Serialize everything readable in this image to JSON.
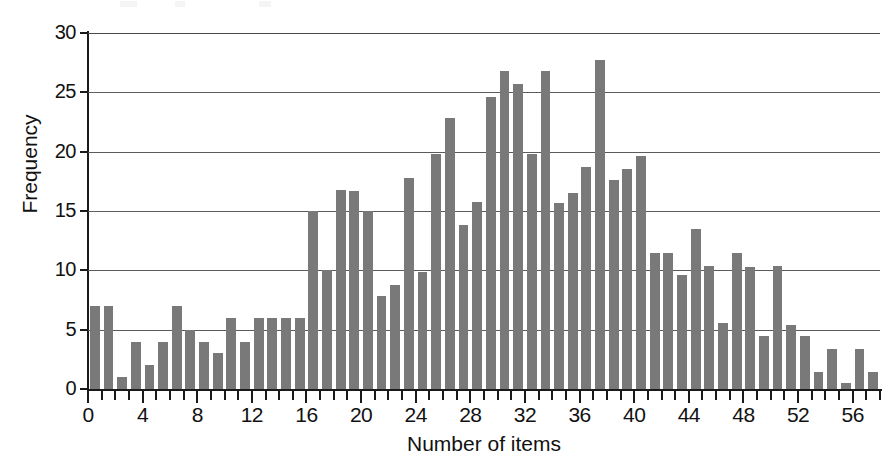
{
  "chart_data": {
    "type": "bar",
    "title": "",
    "subtitle": "",
    "xlabel": "Number of items",
    "ylabel": "Frequency",
    "xlim": [
      0,
      58
    ],
    "ylim": [
      0,
      30
    ],
    "grid": true,
    "legend": null,
    "bar_color": "#797979",
    "axis_color": "#1a1a1a",
    "gridline_color": "#5b5b5b",
    "y_ticks": [
      0,
      5,
      10,
      15,
      20,
      25,
      30
    ],
    "y_tick_labels": [
      "0",
      "5",
      "10",
      "15",
      "20",
      "25",
      "30"
    ],
    "x_ticks": [
      0,
      4,
      8,
      12,
      16,
      20,
      24,
      28,
      32,
      36,
      40,
      44,
      48,
      52,
      56
    ],
    "x_tick_labels": [
      "0",
      "4",
      "8",
      "12",
      "16",
      "20",
      "24",
      "28",
      "32",
      "36",
      "40",
      "44",
      "48",
      "52",
      "56"
    ],
    "x_minor_tick_interval": 1,
    "categories": [
      0,
      1,
      2,
      3,
      4,
      5,
      6,
      7,
      8,
      9,
      10,
      11,
      12,
      13,
      14,
      15,
      16,
      17,
      18,
      19,
      20,
      21,
      22,
      23,
      24,
      25,
      26,
      27,
      28,
      29,
      30,
      31,
      32,
      33,
      34,
      35,
      36,
      37,
      38,
      39,
      40,
      41,
      42,
      43,
      44,
      45,
      46,
      47,
      48,
      49,
      50,
      51,
      52,
      53,
      54,
      55,
      56,
      57
    ],
    "values": [
      7,
      7,
      1,
      4,
      2,
      4,
      7,
      5,
      4,
      3,
      6,
      4,
      6,
      6,
      6,
      6,
      15,
      10,
      16.8,
      16.7,
      15,
      7.8,
      8.8,
      17.8,
      9.9,
      19.8,
      22.8,
      13.8,
      15.8,
      24.6,
      26.8,
      25.7,
      19.8,
      26.8,
      15.7,
      16.5,
      18.7,
      27.7,
      17.6,
      18.5,
      19.6,
      11.5,
      11.5,
      9.6,
      13.5,
      10.4,
      5.6,
      11.5,
      10.3,
      4.5,
      10.4,
      5.4,
      4.5,
      1.4,
      3.4,
      0.5,
      3.4,
      1.4
    ]
  }
}
